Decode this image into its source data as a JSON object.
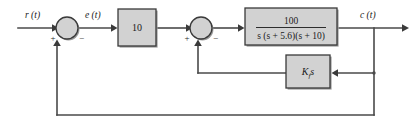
{
  "diagram": {
    "type": "control-system-block-diagram",
    "signals": {
      "input": "r (t)",
      "error": "e (t)",
      "output": "c (t)"
    },
    "blocks": [
      {
        "id": "gain",
        "label": "10",
        "kind": "gain"
      },
      {
        "id": "plant",
        "numerator": "100",
        "denominator": "s (s + 5.6)(s + 10)",
        "kind": "transfer-function"
      },
      {
        "id": "rate-feedback",
        "label_main": "K",
        "label_sub": "f",
        "label_tail": "s",
        "kind": "feedback-gain"
      }
    ],
    "summers": [
      {
        "id": "outer-summer",
        "input_sign": "+",
        "feedback_sign": "−"
      },
      {
        "id": "inner-summer",
        "input_sign": "+",
        "feedback_sign": "−"
      }
    ],
    "colors": {
      "block_fill": "#d2d2d2",
      "block_stroke": "#3a3a3a",
      "wire": "#4a4a4a",
      "shadow": "#9a9a9a",
      "background": "#ffffff"
    }
  }
}
